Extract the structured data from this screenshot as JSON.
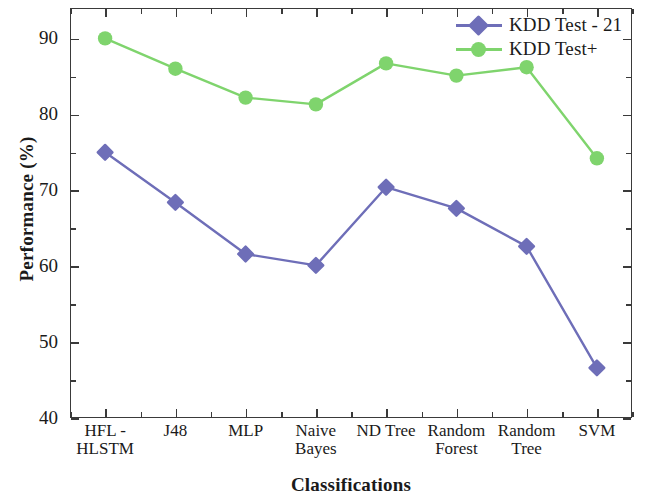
{
  "chart_data": {
    "type": "line",
    "title": "",
    "xlabel": "Classifications",
    "ylabel": "Performance (%)",
    "categories": [
      "HFL -\nHLSTM",
      "J48",
      "MLP",
      "Naive\nBayes",
      "ND Tree",
      "Random\nForest",
      "Random\nTree",
      "SVM"
    ],
    "series": [
      {
        "name": "KDD Test - 21",
        "color": "#6E6EB8",
        "marker": "diamond",
        "values": [
          75.0,
          68.4,
          61.6,
          60.1,
          70.4,
          67.6,
          62.6,
          46.6
        ]
      },
      {
        "name": "KDD Test+",
        "color": "#7FD46D",
        "marker": "circle",
        "values": [
          90.0,
          86.0,
          82.2,
          81.3,
          86.7,
          85.1,
          86.2,
          74.2
        ]
      }
    ],
    "ylim": [
      40,
      94
    ],
    "yticks": [
      40,
      50,
      60,
      70,
      80,
      90
    ],
    "ytick_labels": [
      "40",
      "50",
      "60",
      "70",
      "80",
      "90"
    ],
    "yminor_ticks": [
      45,
      55,
      65,
      75,
      85
    ],
    "grid": false,
    "legend_position": "top-right",
    "axis_color": "#3a3a3a"
  },
  "legend": {
    "entries": [
      {
        "label": "KDD Test - 21"
      },
      {
        "label": "KDD Test+"
      }
    ]
  }
}
